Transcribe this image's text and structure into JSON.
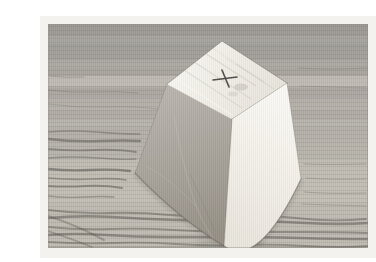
{
  "meta": {
    "description": "Photograph of a white truncated-pyramid (frustum) paper model standing on a wood-grain table. A small handwritten x mark is drawn near the right side of its flat top face. The photo sits inside a pale frame border.",
    "object": "truncated pyramid (frustum) paper model",
    "mark": "x",
    "surface": "wood grain table"
  },
  "colors": {
    "frame": "#f3f2ef",
    "photo_edge": "#8f8d86",
    "wood_top": "#a3a09b",
    "wood_upper_mid": "#b1ada6",
    "wood_lower_mid": "#c0bcb3",
    "wood_bottom": "#c6c1b7",
    "wood_band_dark": "#4e4c47",
    "wood_band_light": "#dcd8cf",
    "grain_dark": "#504e49",
    "top_face_light": "#f7f5f0",
    "top_face_shade": "#e6e2d9",
    "left_face_light": "#b8b4ad",
    "left_face_dark": "#948e84",
    "right_face_light": "#fcfaf6",
    "right_face_shade": "#eae6dd",
    "edge_line": "#6a675f",
    "crease_light": "#cfcbc2",
    "streak": "#c9c5bc",
    "shadow": "#35332f",
    "mark": "#3a3936"
  }
}
